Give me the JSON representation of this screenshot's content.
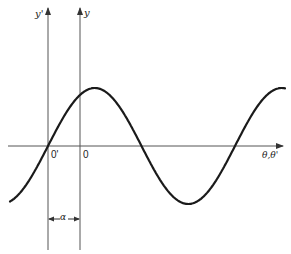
{
  "diagram": {
    "type": "phase-shift-sine-wave",
    "colors": {
      "curve": "#1a1a1a",
      "axis": "#555555",
      "background": "#ffffff"
    },
    "axes": {
      "horizontal_label": "θ,θ'",
      "vertical_primed_label": "y'",
      "vertical_label": "y"
    },
    "origins": {
      "primed": "0'",
      "unprimed": "0"
    },
    "offset_label": "α",
    "geometry": {
      "x_axis_y": 146,
      "x_axis_start": 8,
      "x_axis_end": 283,
      "y_prime_x": 48,
      "y_x": 80,
      "axis_top": 8,
      "axis_bottom": 250,
      "curve_zero_x": 48,
      "period_px": 187,
      "amplitude_px": 58,
      "curve_x_start": 10,
      "curve_x_end": 285,
      "alpha_marker_y": 219
    }
  }
}
